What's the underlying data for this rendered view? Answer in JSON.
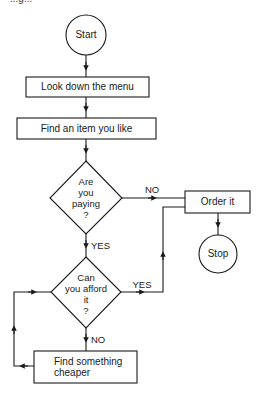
{
  "header": {
    "cut_off_text": "...g..."
  },
  "nodes": {
    "start": {
      "type": "terminal",
      "label": "Start"
    },
    "look_menu": {
      "type": "process",
      "label": "Look down the menu"
    },
    "find_item": {
      "type": "process",
      "label": "Find an item you like"
    },
    "paying": {
      "type": "decision",
      "lines": [
        "Are",
        "you",
        "paying",
        "?"
      ]
    },
    "order": {
      "type": "process",
      "label": "Order it"
    },
    "stop": {
      "type": "terminal",
      "label": "Stop"
    },
    "afford": {
      "type": "decision",
      "lines": [
        "Can",
        "you afford",
        "it",
        "?"
      ]
    },
    "cheaper": {
      "type": "process",
      "lines": [
        "Find something",
        "cheaper"
      ]
    }
  },
  "edges": {
    "paying_no": "NO",
    "paying_yes": "YES",
    "afford_yes": "YES",
    "afford_no": "NO"
  },
  "colors": {
    "stroke": "#1a1a1a",
    "background": "#ffffff"
  }
}
